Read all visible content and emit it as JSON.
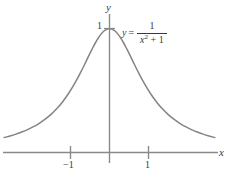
{
  "chart_data": {
    "type": "line",
    "title": "",
    "xlabel": "x",
    "ylabel": "y",
    "function": "y = 1/(x^2 + 1)",
    "equation_label": {
      "lhs": "y",
      "equals": "=",
      "numerator": "1",
      "denominator_var": "x",
      "denominator_exponent": "2",
      "denominator_rest": "+ 1"
    },
    "xlim": [
      -2.7,
      2.8
    ],
    "ylim": [
      -0.1,
      1.18
    ],
    "xticks": [
      -1,
      1
    ],
    "xtick_labels": [
      "−1",
      "1"
    ],
    "yticks": [
      1
    ],
    "ytick_labels": [
      "1"
    ],
    "grid": false,
    "legend": "none",
    "series": [
      {
        "name": "y = 1/(x^2 + 1)",
        "color": "#848484",
        "x": [
          -2.7,
          -2.55,
          -2.4,
          -2.25,
          -2.1,
          -1.95,
          -1.8,
          -1.65,
          -1.5,
          -1.35,
          -1.2,
          -1.05,
          -0.9,
          -0.75,
          -0.6,
          -0.45,
          -0.3,
          -0.15,
          0.0,
          0.15,
          0.3,
          0.45,
          0.6,
          0.75,
          0.9,
          1.05,
          1.2,
          1.35,
          1.5,
          1.65,
          1.8,
          1.95,
          2.1,
          2.25,
          2.4,
          2.55,
          2.7
        ],
        "y": [
          0.1206,
          0.1333,
          0.148,
          0.1649,
          0.1848,
          0.2083,
          0.2358,
          0.2686,
          0.3077,
          0.3544,
          0.4098,
          0.4756,
          0.5525,
          0.64,
          0.7353,
          0.8316,
          0.9174,
          0.978,
          1.0,
          0.978,
          0.9174,
          0.8316,
          0.7353,
          0.64,
          0.5525,
          0.4756,
          0.4098,
          0.3544,
          0.3077,
          0.2686,
          0.2358,
          0.2083,
          0.1848,
          0.1649,
          0.148,
          0.1333,
          0.1206
        ]
      }
    ],
    "colors": {
      "curve": "#848484",
      "axis": "#8a8a8a",
      "text": "#3a3a3a",
      "background": "#ffffff"
    }
  }
}
